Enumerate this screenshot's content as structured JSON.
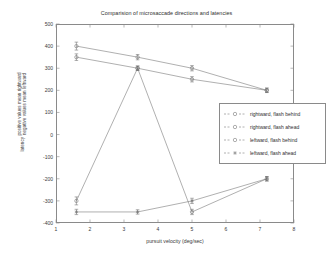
{
  "chart_data": {
    "type": "line",
    "title": "Comparision of microsaccade directions and latencies",
    "xlabel": "pursuit velocity (deg/sec)",
    "ylabel_lines": [
      "latency",
      "positive values mean rightward",
      "negative values mean leftward"
    ],
    "x": [
      1.6,
      3.4,
      5.0,
      7.2
    ],
    "xlim": [
      1,
      8
    ],
    "ylim": [
      -400,
      500
    ],
    "xticks": [
      1,
      2,
      3,
      4,
      5,
      6,
      7,
      8
    ],
    "yticks": [
      500,
      400,
      300,
      200,
      100,
      0,
      -100,
      -200,
      -300,
      -400
    ],
    "grid": false,
    "legend_position": "center-right",
    "series": [
      {
        "name": "rightward, flash behind",
        "marker": "open-circle",
        "values": [
          400,
          350,
          300,
          200
        ],
        "errors": [
          18,
          12,
          12,
          10
        ]
      },
      {
        "name": "rightward, flash ahead",
        "marker": "open-circle",
        "values": [
          350,
          300,
          250,
          200
        ],
        "errors": [
          15,
          10,
          12,
          10
        ]
      },
      {
        "name": "leftward, flash behind",
        "marker": "open-circle",
        "values": [
          -300,
          300,
          -350,
          -200
        ],
        "errors": [
          18,
          10,
          12,
          10
        ]
      },
      {
        "name": "leftward, flash ahead",
        "marker": "asterisk",
        "values": [
          -350,
          -350,
          -300,
          -200
        ],
        "errors": [
          12,
          10,
          12,
          10
        ]
      }
    ]
  }
}
